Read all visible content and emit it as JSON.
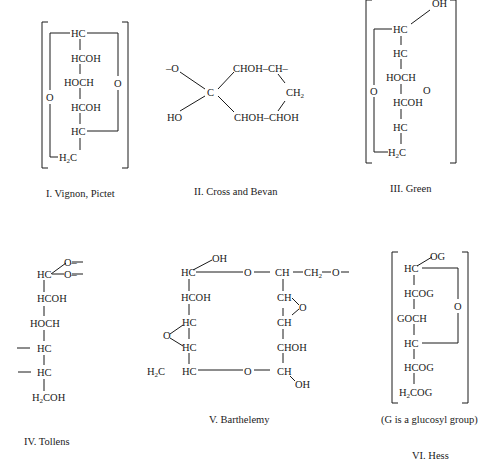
{
  "structures": [
    {
      "id": "I",
      "caption": "I.  Vignon, Pictet",
      "groups": [
        "HC",
        "HCOH",
        "HOCH",
        "HCOH",
        "HC",
        "H2C"
      ],
      "ring_oxygens": [
        "O",
        "O"
      ]
    },
    {
      "id": "II",
      "caption": "II.  Cross and Bevan",
      "groups": [
        "–O",
        "HO",
        "C",
        "CHOH–CH–",
        "CH2",
        "CHOH–CHOH"
      ]
    },
    {
      "id": "III",
      "caption": "III.  Green",
      "groups": [
        "OH",
        "HC",
        "HC",
        "HOCH",
        "HCOH",
        "HC",
        "H2C"
      ],
      "ring_oxygens": [
        "O",
        "O"
      ]
    },
    {
      "id": "IV",
      "caption": "IV.  Tollens",
      "groups": [
        "HC",
        "O–",
        "O–",
        "HCOH",
        "HOCH",
        "HC",
        "HC",
        "H2COH"
      ]
    },
    {
      "id": "V",
      "caption": "V.  Barthelemy",
      "groups": [
        "OH",
        "HC",
        "O",
        "CH",
        "CH2",
        "O",
        "HCOH",
        "HC",
        "O",
        "HC",
        "H2C",
        "HC",
        "O",
        "CH",
        "CH",
        "O",
        "CHOH",
        "CH",
        "OH"
      ]
    },
    {
      "id": "VI",
      "caption": "VI.  Hess",
      "note": "(G is a glucosyl group)",
      "groups": [
        "OG",
        "HC",
        "HCOG",
        "GOCH",
        "HC",
        "HCOG",
        "H2COG"
      ],
      "ring_oxygens": [
        "O"
      ]
    }
  ]
}
